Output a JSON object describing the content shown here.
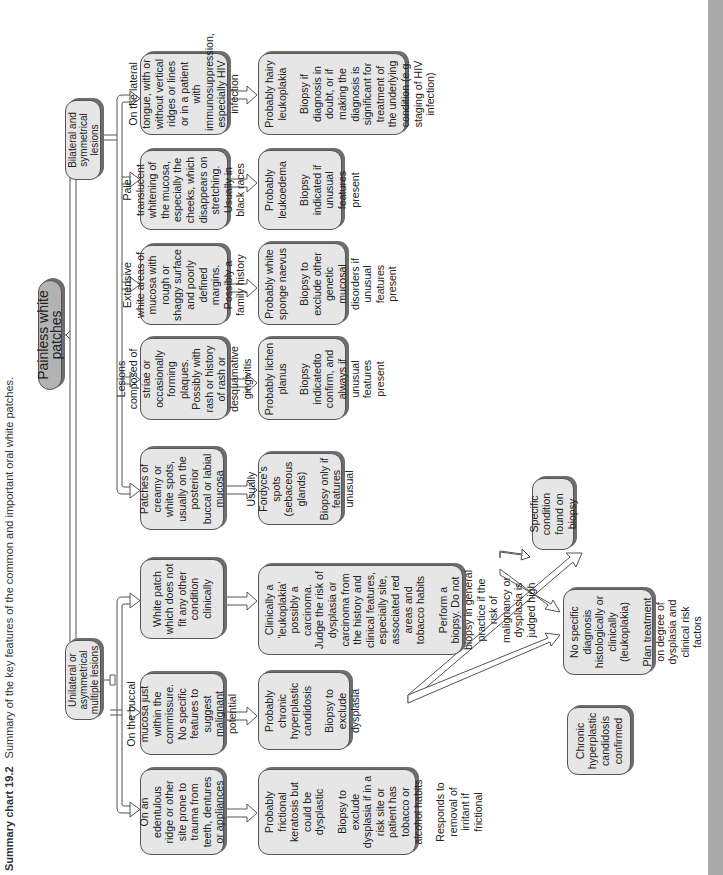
{
  "caption": {
    "label": "Summary chart 19.2",
    "text": "Summary of the key features of the common and important oral white patches."
  },
  "root": {
    "label": "Painless white patches"
  },
  "branches": {
    "unilateral": {
      "label": "Unilateral or asymmetrical multiple lesions"
    },
    "bilateral": {
      "label": "Bilateral and symmetrical lesions"
    }
  },
  "level2": [
    {
      "id": "edentulous",
      "lines": [
        "On an edentulous ridge or other site prone to trauma from teeth, dentures or appliances"
      ]
    },
    {
      "id": "buccal",
      "lines": [
        "On the buccal mucosa just within the commissure. No specific features to suggest malignant potential"
      ]
    },
    {
      "id": "white-patch",
      "lines": [
        "White patch which does not fit any other condition clinically"
      ]
    },
    {
      "id": "creamy",
      "lines": [
        "Patches of creamy or white spots, usually on the posterior buccal or labial mucosa"
      ]
    },
    {
      "id": "striae",
      "lines": [
        "Lesions composed of striae or occasionally forming plaques. Possibly with rash or history of rash or desquamative gingivitis"
      ]
    },
    {
      "id": "extensive",
      "lines": [
        "Extensive white areas of mucosa with rough or shaggy surface and poorly defined margins. Possibly a family history"
      ]
    },
    {
      "id": "pale",
      "lines": [
        "Pale translucent whitening of the mucosa, especially the cheeks, which disappears on stretching. Usually in black races"
      ]
    },
    {
      "id": "lateral-tongue",
      "lines": [
        "On the lateral tongue, with or without vertical ridges or lines or in a patient with immunosuppression, especially HIV infection"
      ]
    }
  ],
  "level3": [
    {
      "id": "frictional",
      "p1": "Probably frictional keratosis but could be dysplastic",
      "p2": "Biopsy to exclude dysplasia if in a risk site or patient has tobacco or alcohol habits",
      "p3": "Responds to removal of irritant if frictional"
    },
    {
      "id": "candidosis",
      "p1": "Probably chronic hyperplastic candidosis",
      "p2": "Biopsy to exclude dysplasia"
    },
    {
      "id": "leukoplakia",
      "p1": "Clinically a 'leukoplakia' possibly a carcinoma. Judge the risk of dysplasia or carcinoma from the history and clinical features, especially site, associated red areas and tobacco habits",
      "p2": "Perform a biopsy. Do not biopsy in general practice if the risk of malignancy or dysplasia is judged high"
    },
    {
      "id": "fordyce",
      "p1": "Usually Fordyce's spots (sebaceous glands)",
      "p2": "Biopsy only if features unusual"
    },
    {
      "id": "lichen",
      "p1": "Probably lichen planus",
      "p2": "Biopsy indicatedto confirm, and always if unusual features present"
    },
    {
      "id": "sponge",
      "p1": "Probably white sponge naevus",
      "p2": "Biopsy to exclude other genetic mucosal disorders if unusual features present"
    },
    {
      "id": "leukoedema",
      "p1": "Probably leukoedema",
      "p2": "Biopsy indicated if unusual features present"
    },
    {
      "id": "hairy",
      "p1": "Probably hairy leukoplakia",
      "p2": "Biopsy if diagnosis in doubt, or if making the diagnosis is significant for treatment of the underlying condition (e.g. staging of HIV infection)"
    }
  ],
  "level4": [
    {
      "id": "specific",
      "p1": "Specific condition found on biopsy"
    },
    {
      "id": "no-specific",
      "p1": "No specific diagnosis histologically or clinically (leukoplakia)",
      "p2": "Plan treatment on degree of dysplasia and clinical risk factors"
    },
    {
      "id": "chc-confirmed",
      "p1": "Chronic hyperplastic candidosis confirmed"
    }
  ]
}
